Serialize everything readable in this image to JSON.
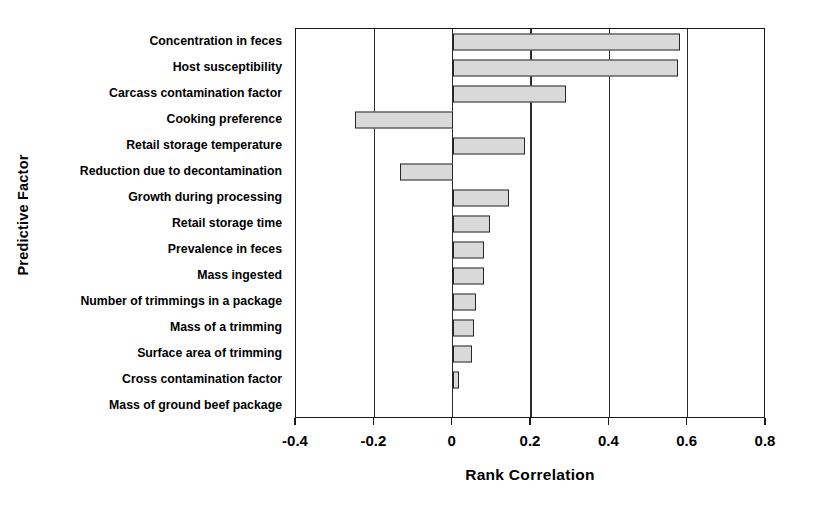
{
  "chart_data": {
    "type": "bar",
    "orientation": "horizontal",
    "title": "",
    "xlabel": "Rank Correlation",
    "ylabel": "Predictive Factor",
    "xlim": [
      -0.4,
      0.8
    ],
    "xticks": [
      -0.4,
      -0.2,
      0,
      0.2,
      0.4,
      0.6,
      0.8
    ],
    "xticklabels": [
      "-0.4",
      "-0.2",
      "0",
      "0.2",
      "0.4",
      "0.6",
      "0.8"
    ],
    "grid": "vertical-only",
    "legend": null,
    "bar_fill_color": "#d9d9d9",
    "bar_edge_color": "#262626",
    "categories": [
      "Concentration in feces",
      "Host susceptibility",
      "Carcass contamination factor",
      "Cooking preference",
      "Retail storage temperature",
      "Reduction due to decontamination",
      "Growth during processing",
      "Retail storage time",
      "Prevalence in feces",
      "Mass ingested",
      "Number of trimmings in a package",
      "Mass of a trimming",
      "Surface area of trimming",
      "Cross contamination factor",
      "Mass of ground beef package"
    ],
    "values": [
      0.58,
      0.575,
      0.29,
      -0.25,
      0.185,
      -0.135,
      0.145,
      0.095,
      0.08,
      0.08,
      0.06,
      0.055,
      0.05,
      0.015,
      0.0
    ]
  }
}
